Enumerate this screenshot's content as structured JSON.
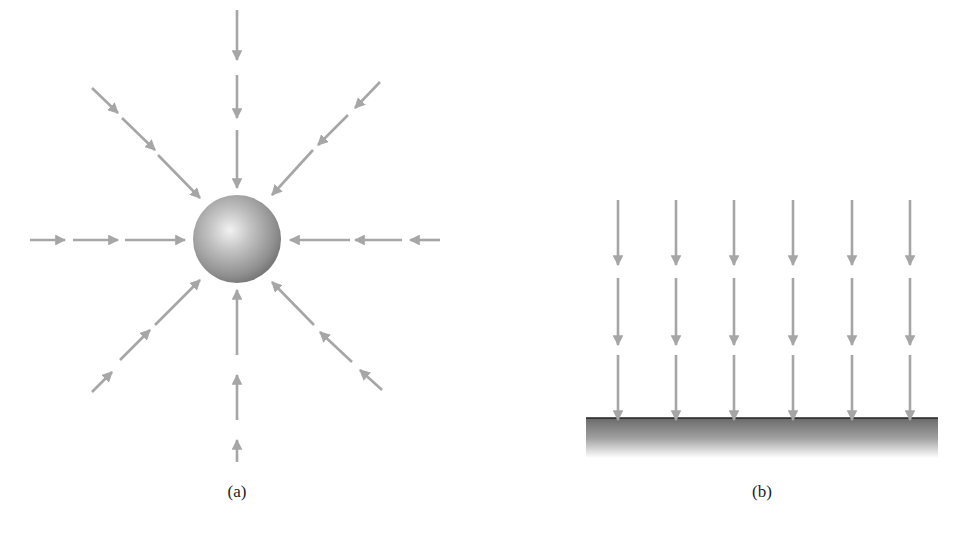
{
  "figure": {
    "panels": [
      {
        "id": "a",
        "caption": "(a)",
        "description": "Radial field lines converging on a sphere",
        "sphere": {
          "cx": 237,
          "cy": 239,
          "r": 44
        },
        "arrow_color": "#a6a6a6",
        "rays": [
          {
            "dir": "down",
            "segments": [
              [
                237,
                10,
                237,
                60
              ],
              [
                237,
                75,
                237,
                118
              ],
              [
                237,
                130,
                237,
                188
              ]
            ]
          },
          {
            "dir": "up",
            "segments": [
              [
                237,
                462,
                237,
                440
              ],
              [
                237,
                420,
                237,
                375
              ],
              [
                237,
                355,
                237,
                290
              ]
            ]
          },
          {
            "dir": "right",
            "segments": [
              [
                30,
                240,
                65,
                240
              ],
              [
                73,
                240,
                118,
                240
              ],
              [
                125,
                240,
                185,
                240
              ]
            ]
          },
          {
            "dir": "left",
            "segments": [
              [
                440,
                240,
                410,
                240
              ],
              [
                402,
                240,
                355,
                240
              ],
              [
                350,
                240,
                290,
                240
              ]
            ]
          },
          {
            "dir": "down-right",
            "segments": [
              [
                92,
                88,
                118,
                113
              ],
              [
                122,
                118,
                155,
                150
              ],
              [
                158,
                155,
                200,
                198
              ]
            ]
          },
          {
            "dir": "down-left",
            "segments": [
              [
                380,
                82,
                355,
                108
              ],
              [
                348,
                115,
                318,
                145
              ],
              [
                313,
                150,
                272,
                195
              ]
            ]
          },
          {
            "dir": "up-right",
            "segments": [
              [
                92,
                392,
                112,
                372
              ],
              [
                120,
                360,
                150,
                330
              ],
              [
                155,
                325,
                200,
                280
              ]
            ]
          },
          {
            "dir": "up-left",
            "segments": [
              [
                382,
                390,
                360,
                370
              ],
              [
                352,
                362,
                320,
                332
              ],
              [
                314,
                325,
                272,
                282
              ]
            ]
          }
        ]
      },
      {
        "id": "b",
        "caption": "(b)",
        "description": "Parallel field lines falling onto a flat surface",
        "columns_x": [
          618,
          676,
          734,
          793,
          852,
          910
        ],
        "rows": [
          [
            200,
            265
          ],
          [
            278,
            345
          ],
          [
            355,
            420
          ]
        ],
        "surface": {
          "x": 586,
          "y": 418,
          "width": 352,
          "height": 40
        },
        "arrow_color": "#a6a6a6"
      }
    ]
  }
}
